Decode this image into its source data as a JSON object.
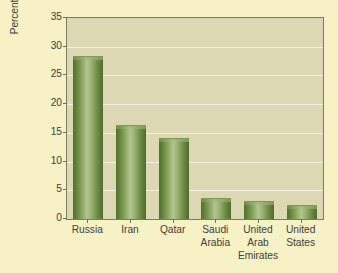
{
  "chart_data": {
    "type": "bar",
    "title": "",
    "subtitle": "",
    "xlabel": "",
    "ylabel": "Percentage of world natural gas reserves, 2003",
    "ylabel_lines": [
      "Percentage of world natural gas reserves,",
      "2003"
    ],
    "categories": [
      "Russia",
      "Iran",
      "Qatar",
      "Saudi Arabia",
      "United Arab Emirates",
      "United States"
    ],
    "category_lines": [
      [
        "Russia"
      ],
      [
        "Iran"
      ],
      [
        "Qatar"
      ],
      [
        "Saudi",
        "Arabia"
      ],
      [
        "United",
        "Arab",
        "Emirates"
      ],
      [
        "United",
        "States"
      ]
    ],
    "values": [
      28.2,
      16.2,
      14.0,
      3.5,
      2.9,
      2.2
    ],
    "ylim": [
      0,
      35
    ],
    "ytick_values": [
      0,
      5,
      10,
      15,
      20,
      25,
      30,
      35
    ],
    "ytick_labels": [
      "0",
      "5",
      "10",
      "15",
      "20",
      "25",
      "30",
      "35"
    ],
    "grid": true,
    "grid_axis": "y",
    "legend": false,
    "legend_position": "none",
    "bar_color": "#7e9a54",
    "bar_highlight_color": "#b2c591",
    "bar_shadow_color": "#4f6b2c",
    "plot_background": "#ddd8b4",
    "figure_background": "#f7f1c6",
    "gridline_color": "#f6f3e2",
    "axis_color": "#7c7b62",
    "text_color": "#3f4039"
  }
}
